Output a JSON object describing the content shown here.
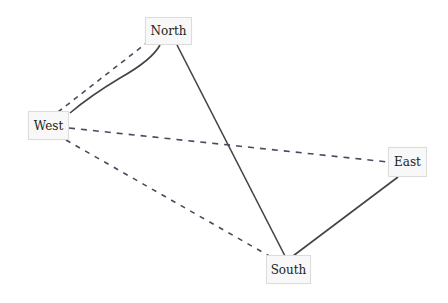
{
  "diagram": {
    "type": "graph",
    "nodes": [
      {
        "id": "north",
        "label": "North"
      },
      {
        "id": "west",
        "label": "West"
      },
      {
        "id": "east",
        "label": "East"
      },
      {
        "id": "south",
        "label": "South"
      }
    ],
    "edges": [
      {
        "from": "West",
        "to": "North",
        "style": "dashed"
      },
      {
        "from": "West",
        "to": "North",
        "style": "solid",
        "shape": "curved"
      },
      {
        "from": "North",
        "to": "South",
        "style": "solid"
      },
      {
        "from": "West",
        "to": "East",
        "style": "dashed"
      },
      {
        "from": "West",
        "to": "South",
        "style": "dashed"
      },
      {
        "from": "East",
        "to": "South",
        "style": "solid"
      }
    ],
    "colors": {
      "solid_edge": "#444444",
      "dashed_edge": "#4a4a5e",
      "node_fill": "#f8f8f8",
      "node_border": "#dcdcdc"
    }
  }
}
